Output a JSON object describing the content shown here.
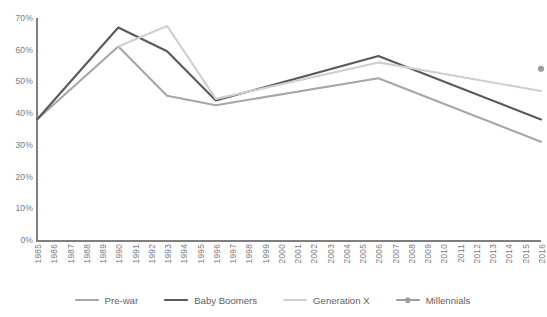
{
  "chart_data": {
    "type": "line",
    "title": "",
    "xlabel": "",
    "ylabel": "",
    "grid": false,
    "legend_position": "bottom",
    "ylim": [
      0,
      70
    ],
    "ytick_labels": [
      "0%",
      "10%",
      "20%",
      "30%",
      "40%",
      "50%",
      "60%",
      "70%"
    ],
    "ytick_values": [
      0,
      10,
      20,
      30,
      40,
      50,
      60,
      70
    ],
    "x": [
      1985,
      1986,
      1987,
      1988,
      1989,
      1990,
      1991,
      1992,
      1993,
      1994,
      1995,
      1996,
      1997,
      1998,
      1999,
      2000,
      2001,
      2002,
      2003,
      2004,
      2005,
      2006,
      2007,
      2008,
      2009,
      2010,
      2011,
      2012,
      2013,
      2014,
      2015,
      2016
    ],
    "xtick_labels": [
      "1985",
      "1986",
      "1987",
      "1988",
      "1989",
      "1990",
      "1991",
      "1992",
      "1993",
      "1994",
      "1995",
      "1996",
      "1997",
      "1998",
      "1999",
      "2000",
      "2001",
      "2002",
      "2003",
      "2004",
      "2005",
      "2006",
      "2007",
      "2008",
      "2009",
      "2010",
      "2011",
      "2012",
      "2013",
      "2014",
      "2015",
      "2016"
    ],
    "series": [
      {
        "name": "Pre-war",
        "color": "#a6a6a6",
        "marker": false,
        "x": [
          1985,
          1990,
          1993,
          1996,
          2006,
          2016
        ],
        "values": [
          38,
          61,
          45.5,
          42.5,
          51,
          31
        ]
      },
      {
        "name": "Baby Boomers",
        "color": "#595959",
        "marker": false,
        "x": [
          1985,
          1990,
          1993,
          1996,
          2006,
          2016
        ],
        "values": [
          38,
          67,
          59.5,
          44,
          58,
          38
        ]
      },
      {
        "name": "Generation X",
        "color": "#cfcfcf",
        "marker": false,
        "x": [
          1990,
          1993,
          1996,
          2006,
          2016
        ],
        "values": [
          61,
          67.5,
          44.5,
          56,
          47
        ]
      },
      {
        "name": "Millennials",
        "color": "#9d9d9d",
        "marker": true,
        "x": [
          2016
        ],
        "values": [
          54
        ]
      }
    ],
    "legend_entries": [
      {
        "label": "Pre-war",
        "color": "#a6a6a6",
        "marker": false
      },
      {
        "label": "Baby Boomers",
        "color": "#595959",
        "marker": false
      },
      {
        "label": "Generation X",
        "color": "#cfcfcf",
        "marker": false
      },
      {
        "label": "Millennials",
        "color": "#9d9d9d",
        "marker": true
      }
    ]
  },
  "axis": {
    "axis_color": "#7f7f7f",
    "tick_text_color": "#7b7b7b"
  }
}
